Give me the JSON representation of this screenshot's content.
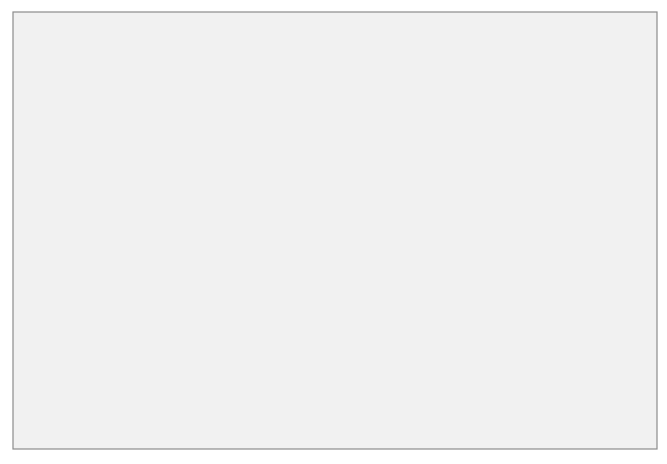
{
  "diagram": {
    "begin_a": {
      "label": "Begin",
      "tag": "(a)"
    },
    "begin_b": {
      "label": "Begin",
      "tag": "(b)"
    },
    "inputs": {
      "skin_temperature": "Skin temperature",
      "core_temperature": "Core temperature"
    },
    "nodes": {
      "cerebral_cortex": [
        "Cerebral",
        "cortex"
      ],
      "peripheral_thermoreceptors": [
        "Peripheral",
        "thermoreceptors"
      ],
      "central_thermoreceptors": [
        "Central",
        "thermoreceptors"
      ],
      "hypothalamus": [
        "Hypothalamus"
      ],
      "adrenal_medulla": [
        "Adrenal",
        "medulla"
      ],
      "sweat_glands": [
        "Sweat",
        "glands"
      ],
      "skin_arterioles": [
        "Skin",
        "arterioles"
      ],
      "skeletal_muscles": [
        "Skeletal",
        "muscles"
      ]
    },
    "outputs": {
      "epinephrine": "Epinephrine"
    },
    "pathway_labels": {
      "voluntary": "“Voluntary” motor responses",
      "involuntary": "“Involuntary” motor responses",
      "sympathetic": [
        "Via",
        "sympathetic nerves"
      ],
      "motor": [
        "Via",
        "motor nerves"
      ]
    },
    "colors": {
      "background": "#f1f1f1",
      "box_front": "#b9b9b9",
      "box_top": "#8f8f8f",
      "box_side": "#7b7b7b",
      "arrow_fill": "#ffffff",
      "frame_stroke": "#8c8c8c"
    }
  }
}
